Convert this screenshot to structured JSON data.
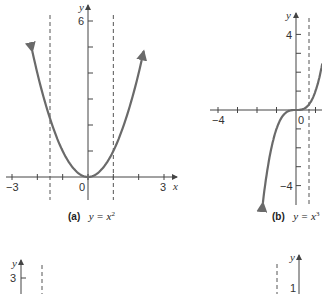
{
  "chart_data": [
    {
      "panel": "a",
      "type": "line",
      "title": "y = x^2",
      "caption_label": "(a)",
      "caption_eq": "y = x",
      "caption_exp": "2",
      "xlabel": "x",
      "ylabel": "y",
      "xlim": [
        -3,
        3
      ],
      "ylim": [
        0,
        6
      ],
      "x_tick_labels": [
        "-3",
        "0",
        "3"
      ],
      "y_tick_labels": [
        "6"
      ],
      "x_ticks": [
        -3,
        -2,
        -1,
        0,
        1,
        2,
        3
      ],
      "y_ticks": [
        1,
        2,
        3,
        4,
        5,
        6
      ],
      "dashed_verticals": [
        -1.5,
        1
      ],
      "series": [
        {
          "name": "y = x^2",
          "function": "x^2",
          "x_range": [
            -2.2,
            2.2
          ]
        }
      ],
      "color": "#6a6a6a",
      "grid": false
    },
    {
      "panel": "b",
      "type": "line",
      "title": "y = x^3",
      "caption_label": "(b)",
      "caption_eq": "y = x",
      "caption_exp": "3",
      "xlabel": "x",
      "ylabel": "y",
      "xlim": [
        -4,
        1
      ],
      "ylim": [
        -4,
        4
      ],
      "x_tick_labels": [
        "-4",
        "0"
      ],
      "y_tick_labels": [
        "4",
        "-4"
      ],
      "x_ticks": [
        -4,
        -3,
        -2,
        -1,
        0,
        1
      ],
      "y_ticks": [
        -4,
        -3,
        -2,
        -1,
        1,
        2,
        3,
        4
      ],
      "dashed_verticals": [
        0.7
      ],
      "series": [
        {
          "name": "y = x^3",
          "function": "x^3",
          "x_range": [
            -1.7,
            1.35
          ]
        }
      ],
      "color": "#6a6a6a",
      "grid": false
    },
    {
      "panel": "c",
      "type": "line",
      "partial": true,
      "ylabel": "y",
      "y_tick_labels": [
        "3"
      ]
    },
    {
      "panel": "d",
      "type": "line",
      "partial": true,
      "ylabel": "y",
      "y_tick_labels": [
        "1"
      ]
    }
  ]
}
